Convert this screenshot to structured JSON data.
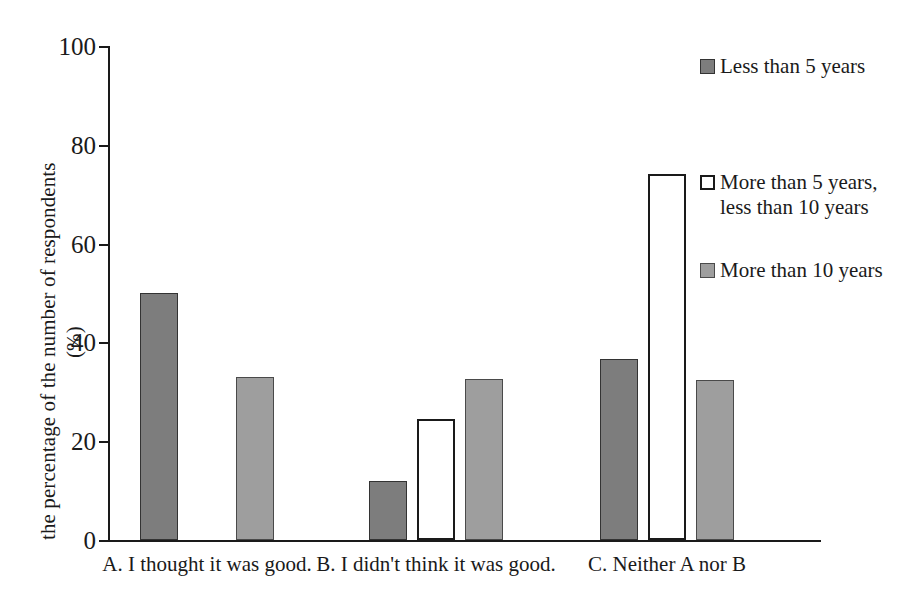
{
  "chart_data": {
    "type": "bar",
    "title": "",
    "subtitle": "",
    "xlabel": "",
    "ylabel": "the percentage of the number of respondents",
    "ylabel_unit": "(%)",
    "ylim": [
      0,
      100
    ],
    "yticks": [
      0,
      20,
      40,
      60,
      80,
      100
    ],
    "grid": false,
    "legend_position": "right",
    "categories": [
      "A. I thought it was good.",
      "B. I didn't think it was good.",
      "C. Neither A nor B"
    ],
    "series": [
      {
        "name": "Less than 5 years",
        "swatch": "dark",
        "color": "#7d7d7d",
        "values": [
          50,
          12,
          36.7
        ]
      },
      {
        "name": "More than 5 years,\nless than 10 years",
        "swatch": "white",
        "color": "#ffffff",
        "values": [
          0,
          24.4,
          74
        ]
      },
      {
        "name": "More than 10 years",
        "swatch": "light",
        "color": "#9e9e9e",
        "values": [
          33,
          32.6,
          32.3
        ]
      }
    ]
  },
  "axis": {
    "tick_labels": [
      "0",
      "20",
      "40",
      "60",
      "80",
      "100"
    ]
  },
  "legend": {
    "entries": [
      {
        "label": "Less than 5 years",
        "swatch": "dark"
      },
      {
        "label": "More than 5 years,\nless than 10 years",
        "swatch": "white"
      },
      {
        "label": "More than 10 years",
        "swatch": "light"
      }
    ]
  }
}
